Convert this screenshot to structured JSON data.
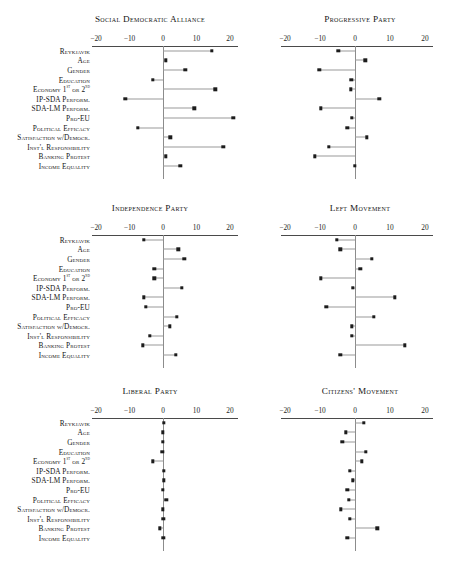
{
  "chart_data": {
    "type": "scatter",
    "plot_style": "coefficient-dot-plot-grid",
    "n_panels": 6,
    "panel_layout": [
      2,
      2,
      2
    ],
    "shared_categories": [
      "Reykjavik",
      "Age",
      "Gender",
      "Education",
      "Economy 1st or 2nd",
      "IP-SDA Perform.",
      "SDA-LM Perform.",
      "Pro-EU",
      "Political Efficacy",
      "Satisfaction w/Democr.",
      "Inst'l Responsibility",
      "Banking Protest",
      "Income Equality"
    ],
    "xlabel": "",
    "ylabel": "",
    "xlim": [
      -20,
      20
    ],
    "xticks": [
      -20,
      -10,
      0,
      10,
      20
    ],
    "xtick_labels": [
      "−20",
      "−10",
      "0",
      "10",
      "20"
    ],
    "grid": false,
    "reference_line": 0,
    "legend": null,
    "panels": [
      {
        "title": "Social Democratic Alliance",
        "values": [
          14.6,
          0.8,
          6.6,
          -3.0,
          15.6,
          -11.2,
          9.4,
          21.0,
          -7.6,
          2.2,
          18.0,
          0.9,
          5.2
        ]
      },
      {
        "title": "Progressive Party",
        "values": [
          -4.8,
          2.9,
          -10.2,
          -1.1,
          -1.2,
          6.9,
          -9.8,
          -1.0,
          -2.2,
          3.4,
          -7.4,
          -11.4,
          0.0
        ]
      },
      {
        "title": "Independence Party",
        "values": [
          -5.8,
          4.6,
          6.4,
          -2.6,
          -2.6,
          5.6,
          -5.8,
          -5.2,
          4.1,
          2.0,
          -4.0,
          -6.0,
          3.9
        ]
      },
      {
        "title": "Left Movement",
        "values": [
          -5.2,
          -4.2,
          4.8,
          1.5,
          -9.8,
          -0.6,
          11.4,
          -8.2,
          5.4,
          -1.0,
          -1.0,
          14.2,
          -4.2
        ]
      },
      {
        "title": "Liberal Party",
        "values": [
          0.2,
          0.0,
          0.0,
          -0.2,
          -3.0,
          0.2,
          0.2,
          -0.1,
          1.0,
          0.0,
          0.1,
          -0.9,
          0.1
        ]
      },
      {
        "title": "Citizens' Movement",
        "values": [
          2.5,
          -2.6,
          -3.6,
          3.0,
          1.9,
          -1.4,
          -0.6,
          -2.2,
          -1.8,
          -4.0,
          -1.4,
          6.4,
          -2.2
        ]
      }
    ]
  }
}
